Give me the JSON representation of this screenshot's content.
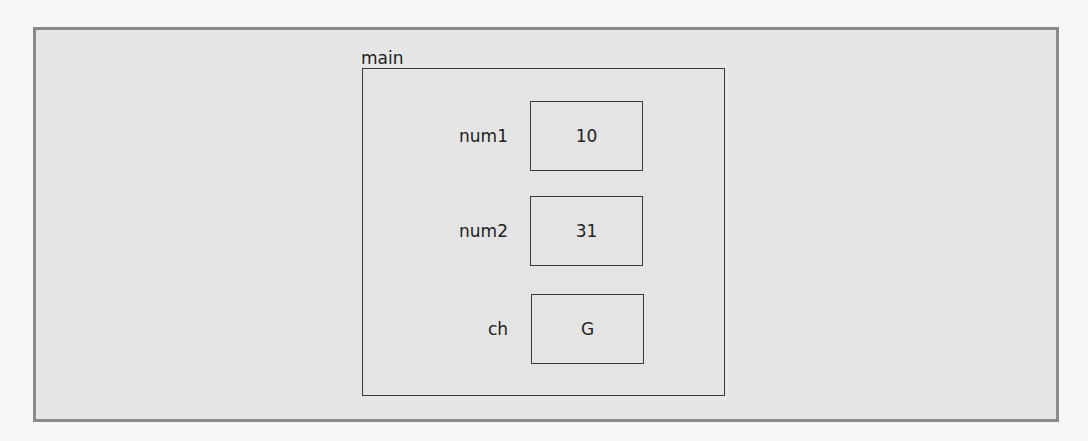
{
  "frame": {
    "name": "main"
  },
  "variables": [
    {
      "name": "num1",
      "value": "10"
    },
    {
      "name": "num2",
      "value": "31"
    },
    {
      "name": "ch",
      "value": "G"
    }
  ],
  "colors": {
    "outer_border": "#8a8a8a",
    "outer_fill": "#e6e6e6",
    "frame_border": "#3a3a3a"
  }
}
